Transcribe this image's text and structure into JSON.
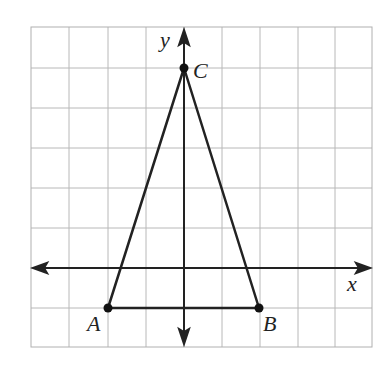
{
  "diagram": {
    "type": "coordinate-grid-triangle",
    "grid": {
      "left": 31,
      "top": 27,
      "right": 372,
      "bottom": 347,
      "columns": 9,
      "rows": 8,
      "line_color": "#b8b8b8",
      "border_color": "#b0b0b0"
    },
    "axes": {
      "color": "#222222",
      "x_axis_y": 268,
      "y_axis_x": 184,
      "x_label": "x",
      "y_label": "y"
    },
    "triangle": {
      "stroke": "#222222",
      "vertices": [
        {
          "name": "A",
          "px": 108,
          "py": 308,
          "grid_x": -2,
          "grid_y": -1
        },
        {
          "name": "B",
          "px": 259,
          "py": 308,
          "grid_x": 2,
          "grid_y": -1
        },
        {
          "name": "C",
          "px": 184,
          "py": 68,
          "grid_x": 0,
          "grid_y": 5
        }
      ]
    },
    "labels": {
      "A": "A",
      "B": "B",
      "C": "C",
      "x": "x",
      "y": "y"
    }
  }
}
